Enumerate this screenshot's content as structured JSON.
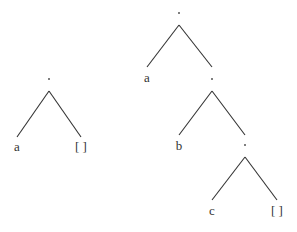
{
  "diagram": {
    "type": "tree",
    "colors": {
      "line": "#333333",
      "text": "#333333",
      "background": "#ffffff"
    },
    "trees": [
      {
        "name": "list-a",
        "root": {
          "label": ".",
          "children": [
            {
              "label": "a"
            },
            {
              "label": "[ ]"
            }
          ]
        }
      },
      {
        "name": "list-a-b-c",
        "root": {
          "label": ".",
          "children": [
            {
              "label": "a"
            },
            {
              "label": ".",
              "children": [
                {
                  "label": "b"
                },
                {
                  "label": ".",
                  "children": [
                    {
                      "label": "c"
                    },
                    {
                      "label": "[ ]"
                    }
                  ]
                }
              ]
            }
          ]
        }
      }
    ]
  },
  "labels": {
    "t1_root": ".",
    "t1_left": "a",
    "t1_right": "[ ]",
    "t2_root": ".",
    "t2_a": "a",
    "t2_n2": ".",
    "t2_b": "b",
    "t2_n3": ".",
    "t2_c": "c",
    "t2_nil": "[ ]"
  }
}
